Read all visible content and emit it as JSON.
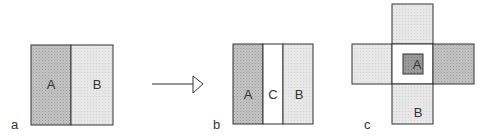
{
  "panels": {
    "a": {
      "label": "a",
      "regions": [
        "A",
        "B"
      ]
    },
    "b": {
      "label": "b",
      "regions": [
        "A",
        "C",
        "B"
      ]
    },
    "c": {
      "label": "c",
      "regions": [
        "A",
        "B"
      ]
    }
  },
  "colors": {
    "dark_fill": "#b9b9b9",
    "light_fill": "#e3e3e3",
    "inner_fill": "#8f8f8f",
    "white": "#ffffff",
    "stroke": "#333333"
  }
}
